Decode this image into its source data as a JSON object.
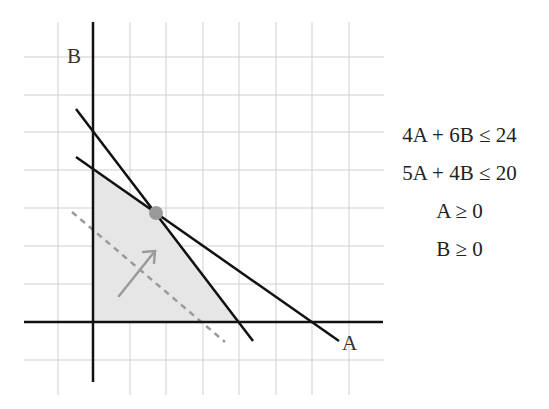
{
  "axes": {
    "x_label": "A",
    "y_label": "B"
  },
  "constraints": [
    "4A + 6B ≤ 24",
    "5A + 4B ≤ 20",
    "A ≥ 0",
    "B ≥ 0"
  ],
  "lines": [
    {
      "name": "4A + 6B = 24",
      "a_intercept": 6,
      "b_intercept": 4
    },
    {
      "name": "5A + 4B = 20",
      "a_intercept": 4,
      "b_intercept": 5
    }
  ],
  "optimal_point": {
    "A": 1.714,
    "B": 2.857
  },
  "colors": {
    "feasible_fill": "#e6e6e6",
    "line": "#111111",
    "grid": "#cccccc",
    "point": "#999999",
    "objective": "#999999"
  }
}
